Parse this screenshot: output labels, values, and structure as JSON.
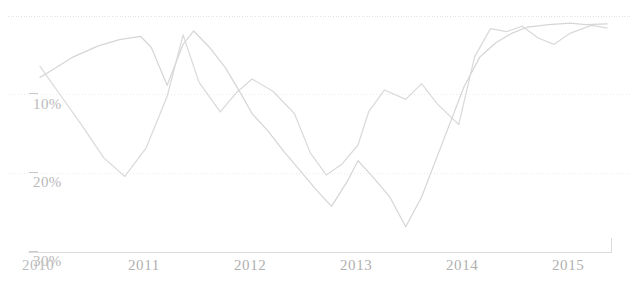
{
  "chart": {
    "background_color": "#ffffff",
    "line_color": "#d6d6d6",
    "gridline_color": "#ececec",
    "axis_color": "#dcdcdc",
    "tick_color": "#c9c9c9",
    "label_color": "#b9b9b9"
  },
  "chart_data": {
    "type": "line",
    "title": "",
    "subtitle": "",
    "xlabel": "",
    "ylabel": "",
    "grid": true,
    "legend": "none",
    "y_inverted": true,
    "ylim": [
      0,
      30
    ],
    "xlim": [
      2010,
      2015.4
    ],
    "ytick_labels": [
      "10%",
      "20%",
      "30%"
    ],
    "ytick_values": [
      10,
      20,
      30
    ],
    "xtick_labels": [
      "2010",
      "2011",
      "2012",
      "2013",
      "2014",
      "2015"
    ],
    "xtick_values": [
      2010,
      2011,
      2012,
      2013,
      2014,
      2015
    ],
    "series": [
      {
        "name": "series-a",
        "color": "#d6d6d6",
        "x": [
          2010.0,
          2010.1,
          2010.3,
          2010.55,
          2010.75,
          2010.95,
          2011.05,
          2011.2,
          2011.35,
          2011.45,
          2011.6,
          2011.75,
          2011.9,
          2012.0,
          2012.15,
          2012.3,
          2012.45,
          2012.6,
          2012.75,
          2012.9,
          2013.0,
          2013.15,
          2013.3,
          2013.45,
          2013.6,
          2013.8,
          2014.0,
          2014.15,
          2014.3,
          2014.45,
          2014.6,
          2014.8,
          2015.0,
          2015.15,
          2015.35
        ],
        "y": [
          7.8,
          7.0,
          5.3,
          3.8,
          3.0,
          2.6,
          4.0,
          8.8,
          3.6,
          1.9,
          4.0,
          6.6,
          10.0,
          12.4,
          14.6,
          17.2,
          19.6,
          22.0,
          24.2,
          21.0,
          18.4,
          20.6,
          23.0,
          26.8,
          23.0,
          16.0,
          9.0,
          5.2,
          3.4,
          2.2,
          1.4,
          1.1,
          0.9,
          1.1,
          1.0
        ]
      },
      {
        "name": "series-b",
        "color": "#dadada",
        "x": [
          2010.0,
          2010.2,
          2010.4,
          2010.6,
          2010.8,
          2011.0,
          2011.2,
          2011.35,
          2011.5,
          2011.7,
          2011.85,
          2012.0,
          2012.2,
          2012.4,
          2012.55,
          2012.7,
          2012.85,
          2013.0,
          2013.1,
          2013.25,
          2013.45,
          2013.6,
          2013.75,
          2013.95,
          2014.1,
          2014.25,
          2014.4,
          2014.55,
          2014.7,
          2014.85,
          2015.0,
          2015.2,
          2015.35
        ],
        "y": [
          6.4,
          10.2,
          14.0,
          18.0,
          20.4,
          16.8,
          10.2,
          2.4,
          8.4,
          12.2,
          9.8,
          8.0,
          9.6,
          12.4,
          17.4,
          20.2,
          18.8,
          16.4,
          12.2,
          9.4,
          10.6,
          8.6,
          11.2,
          13.8,
          5.2,
          1.6,
          2.0,
          1.3,
          2.8,
          3.6,
          2.2,
          1.2,
          1.5
        ]
      }
    ]
  },
  "yaxis": {
    "ticks": [
      {
        "label": "10%",
        "value": 10
      },
      {
        "label": "20%",
        "value": 20
      },
      {
        "label": "30%",
        "value": 30
      }
    ]
  },
  "xaxis": {
    "ticks": [
      {
        "label": "2010",
        "value": 2010
      },
      {
        "label": "2011",
        "value": 2011
      },
      {
        "label": "2012",
        "value": 2012
      },
      {
        "label": "2013",
        "value": 2013
      },
      {
        "label": "2014",
        "value": 2014
      },
      {
        "label": "2015",
        "value": 2015
      }
    ]
  }
}
